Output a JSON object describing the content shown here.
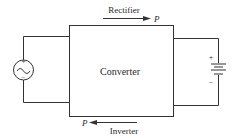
{
  "diagram": {
    "block_label": "Converter",
    "top_arrow": {
      "label": "Rectifier",
      "power_symbol": "P",
      "direction": "right"
    },
    "bottom_arrow": {
      "label": "Inverter",
      "power_symbol": "P",
      "direction": "left"
    },
    "ac_source": {
      "icon": "ac-source-icon",
      "plus": "+",
      "minus": "−"
    },
    "battery": {
      "icon": "battery-icon",
      "plus": "+",
      "minus": "−"
    }
  },
  "colors": {
    "stroke": "#333333",
    "text": "#2a2a2a"
  }
}
